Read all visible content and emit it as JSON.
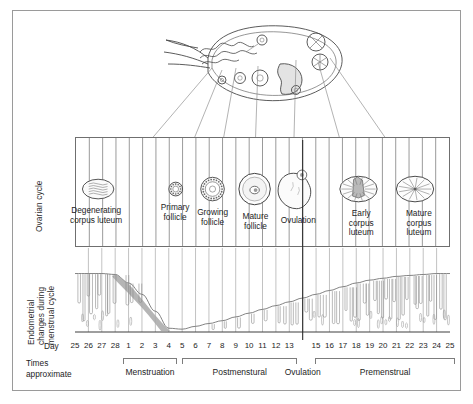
{
  "figure": {
    "axis_labels": {
      "ovarian": "Ovarian cycle",
      "endometrial_line1": "Endometrial",
      "endometrial_line2": "changes during",
      "endometrial_line3": "menstrual cycle"
    },
    "day_caption": "Day",
    "times_caption": "Times\napproximate"
  },
  "ovary_illustration": {
    "name": "ovary-cross-section",
    "description": "Ovary with fimbriae and developing follicles around the periphery"
  },
  "ovarian_stages": [
    {
      "label": "Degenerating\ncorpus luteum",
      "day": 26.5,
      "icon": "degenerating-corpus-luteum",
      "radius_x": 16,
      "radius_y": 10
    },
    {
      "label": "Primary\nfollicle",
      "day": 4.4,
      "icon": "primary-follicle",
      "radius_x": 7,
      "radius_y": 7
    },
    {
      "label": "Growing\nfollicle",
      "day": 7.2,
      "icon": "growing-follicle",
      "radius_x": 12,
      "radius_y": 12
    },
    {
      "label": "Mature\nfollicle",
      "day": 10.4,
      "icon": "mature-follicle",
      "radius_x": 16,
      "radius_y": 16
    },
    {
      "label": "Ovulation",
      "day": 13.6,
      "icon": "ovulation-rupture",
      "radius_x": 19,
      "radius_y": 20
    },
    {
      "label": "Early\ncorpus\nluteum",
      "day": 18.3,
      "icon": "early-corpus-luteum",
      "radius_x": 19,
      "radius_y": 13
    },
    {
      "label": "Mature\ncorpus\nluteum",
      "day": 22.6,
      "icon": "mature-corpus-luteum",
      "radius_x": 19,
      "radius_y": 13
    }
  ],
  "chart_data": {
    "type": "area",
    "title": "Endometrial changes during menstrual cycle",
    "xlabel": "Day",
    "ylabel": "Endometrial thickness",
    "grid": true,
    "legend": "none",
    "x": [
      25,
      26,
      27,
      28,
      1,
      2,
      3,
      4,
      5,
      6,
      7,
      8,
      9,
      10,
      11,
      12,
      13,
      14,
      15,
      16,
      17,
      18,
      19,
      20,
      21,
      22,
      23,
      24,
      25
    ],
    "categories": [
      "25",
      "26",
      "27",
      "28",
      "1",
      "2",
      "3",
      "4",
      "5",
      "6",
      "7",
      "8",
      "9",
      "10",
      "11",
      "12",
      "13",
      "14",
      "15",
      "16",
      "17",
      "18",
      "19",
      "20",
      "21",
      "22",
      "23",
      "24",
      "25"
    ],
    "values": [
      62,
      62,
      62,
      61,
      52,
      40,
      22,
      4,
      3,
      6,
      9,
      12,
      16,
      20,
      24,
      28,
      32,
      36,
      40,
      44,
      48,
      52,
      55,
      57,
      59,
      60,
      61,
      62,
      62
    ],
    "ylim": [
      0,
      70
    ],
    "annotations": [
      {
        "text": "Menstrual shedding (shaded)",
        "x_start": 28,
        "x_end": 4
      },
      {
        "text": "Ovulation arrow",
        "x": 14
      }
    ]
  },
  "axis_days": [
    {
      "label": "25"
    },
    {
      "label": "26"
    },
    {
      "label": "27"
    },
    {
      "label": "28"
    },
    {
      "label": "1"
    },
    {
      "label": "2"
    },
    {
      "label": "3"
    },
    {
      "label": "4"
    },
    {
      "label": "5"
    },
    {
      "label": "6"
    },
    {
      "label": "7"
    },
    {
      "label": "8"
    },
    {
      "label": "9"
    },
    {
      "label": "10"
    },
    {
      "label": "11"
    },
    {
      "label": "12"
    },
    {
      "label": "13"
    },
    {
      "label": ""
    },
    {
      "label": "15"
    },
    {
      "label": "16"
    },
    {
      "label": "17"
    },
    {
      "label": "18"
    },
    {
      "label": "19"
    },
    {
      "label": "20"
    },
    {
      "label": "21"
    },
    {
      "label": "22"
    },
    {
      "label": "23"
    },
    {
      "label": "24"
    },
    {
      "label": "25"
    }
  ],
  "phases": [
    {
      "name": "Menstruation",
      "start_index": 3.6,
      "end_index": 7.6
    },
    {
      "name": "Postmenstural",
      "start_index": 8.0,
      "end_index": 16.6
    },
    {
      "name": "Ovulation",
      "start_index": 17.0,
      "end_index": 17.0
    },
    {
      "name": "Premenstrual",
      "start_index": 17.9,
      "end_index": 28.4
    }
  ],
  "colors": {
    "ink": "#1d1d1d",
    "frame": "#9a9a9a",
    "grid": "#6f6f6f",
    "shed": "#a8a8a8",
    "line": "#6d6d6d"
  }
}
